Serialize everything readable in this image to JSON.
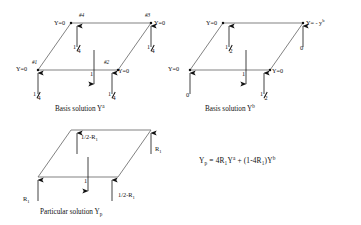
{
  "figure": {
    "kind": "engineering-diagram",
    "ink_color": "#111111",
    "line_color": "#555555",
    "background": "#ffffff"
  },
  "panels": [
    {
      "id": "basis-a",
      "caption_prefix": "Basis solution Y",
      "caption_sup": "a",
      "nodes": [
        {
          "tag": "#1",
          "value": "Y=0"
        },
        {
          "tag": "#2",
          "value": "Y=0"
        },
        {
          "tag": "#3",
          "value": "Y=0"
        },
        {
          "tag": "#4",
          "value": "Y=0"
        }
      ],
      "loads": [
        {
          "name": "node1-load",
          "num": "1",
          "den": "4",
          "type": "fraction",
          "dir": "up"
        },
        {
          "name": "node2-load",
          "num": "1",
          "den": "4",
          "type": "fraction",
          "dir": "up"
        },
        {
          "name": "node3-load",
          "num": "1",
          "den": "4",
          "type": "fraction",
          "dir": "up"
        },
        {
          "name": "node4-load",
          "num": "1",
          "den": "4",
          "type": "fraction",
          "dir": "up"
        },
        {
          "name": "center-load",
          "value": "1",
          "type": "scalar",
          "dir": "down"
        }
      ]
    },
    {
      "id": "basis-b",
      "caption_prefix": "Basis solution Y",
      "caption_sup": "b",
      "nodes": [
        {
          "tag": "",
          "value": "Y=0"
        },
        {
          "tag": "",
          "value": "Y=0"
        },
        {
          "tag": "",
          "value": "Y= - y",
          "value_sup": "b"
        },
        {
          "tag": "",
          "value": "Y=0"
        }
      ],
      "loads": [
        {
          "name": "node1-load",
          "value": "0",
          "type": "scalar",
          "dir": "up"
        },
        {
          "name": "node2-load",
          "num": "1",
          "den": "2",
          "type": "fraction",
          "dir": "up"
        },
        {
          "name": "node3-load",
          "value": "0",
          "type": "scalar",
          "dir": "up"
        },
        {
          "name": "node4-load",
          "num": "1",
          "den": "2",
          "type": "fraction",
          "dir": "up"
        },
        {
          "name": "center-load",
          "value": "1",
          "type": "scalar",
          "dir": "down"
        }
      ]
    },
    {
      "id": "particular",
      "caption_prefix": "Particular solution Y",
      "caption_sub": "p",
      "nodes": [],
      "loads": [
        {
          "name": "node1-load",
          "value": "R",
          "value_sub": "1",
          "type": "symbol",
          "dir": "up"
        },
        {
          "name": "node2-load",
          "value": "1/2-R",
          "value_sub": "1",
          "type": "expression",
          "dir": "up"
        },
        {
          "name": "node3-load",
          "value": "R",
          "value_sub": "1",
          "type": "symbol",
          "dir": "up"
        },
        {
          "name": "node4-load",
          "value": "1/2-R",
          "value_sub": "1",
          "type": "expression",
          "dir": "up"
        },
        {
          "name": "center-load",
          "value": "1",
          "type": "scalar",
          "dir": "down"
        }
      ]
    }
  ],
  "equation": {
    "lhs": "Y",
    "lhs_sub": "p",
    "body": " = 4R",
    "body_sub1": "1",
    "term_a": "Y",
    "term_a_sup": "a",
    "middle": " + (1-4R",
    "body_sub2": "1",
    "tail": ")Y",
    "term_b_sup": "b"
  }
}
